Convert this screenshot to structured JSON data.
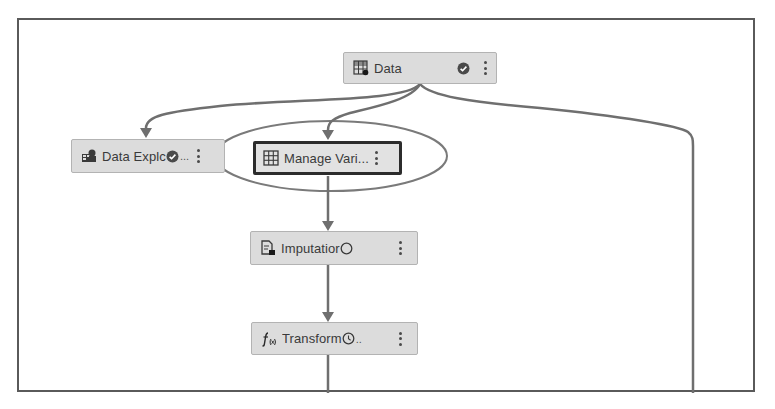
{
  "canvas": {
    "frame_color": "#5a5a5a",
    "node_fill": "#dcdcdc",
    "node_border": "#b3b3b3",
    "connector_color": "#707070",
    "highlight_ellipse_color": "#7a7a7a"
  },
  "nodes": [
    {
      "id": "data",
      "label": "Data",
      "icon": "data-table-icon",
      "status": "completed-check-icon",
      "menu": "more-options-icon",
      "selected": false
    },
    {
      "id": "data-exploration",
      "label": "Data Explc",
      "truncation": "...",
      "icon": "data-exploration-icon",
      "status": "completed-check-icon",
      "menu": "more-options-icon",
      "selected": false
    },
    {
      "id": "manage-variables",
      "label": "Manage Vari...",
      "icon": "grid-table-icon",
      "status": "",
      "menu": "more-options-icon",
      "selected": true,
      "highlighted": true
    },
    {
      "id": "imputation",
      "label": "Imputatior",
      "icon": "imputation-icon",
      "status": "pending-circle-icon",
      "menu": "more-options-icon",
      "selected": false
    },
    {
      "id": "transformations",
      "label": "Transform",
      "truncation": "..",
      "icon": "function-icon",
      "status": "pending-clock-icon",
      "menu": "more-options-icon",
      "selected": false
    }
  ],
  "edges": [
    {
      "from": "data",
      "to": "data-exploration"
    },
    {
      "from": "data",
      "to": "manage-variables"
    },
    {
      "from": "data",
      "to": "offscreen-right"
    },
    {
      "from": "manage-variables",
      "to": "imputation"
    },
    {
      "from": "imputation",
      "to": "transformations"
    },
    {
      "from": "transformations",
      "to": "offscreen-bottom"
    }
  ]
}
